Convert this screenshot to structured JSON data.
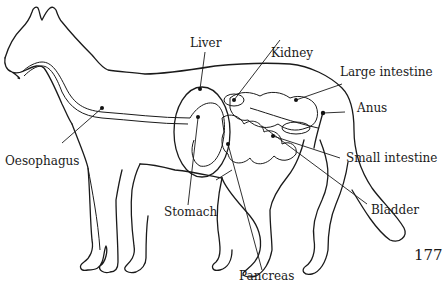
{
  "diagram": {
    "page_number": "177",
    "labels": [
      {
        "id": "liver",
        "text": "Liver"
      },
      {
        "id": "kidney",
        "text": "Kidney"
      },
      {
        "id": "large-intestine",
        "text": "Large intestine"
      },
      {
        "id": "anus",
        "text": "Anus"
      },
      {
        "id": "small-intestine",
        "text": "Small intestine"
      },
      {
        "id": "bladder",
        "text": "Bladder"
      },
      {
        "id": "pancreas",
        "text": "Pancreas"
      },
      {
        "id": "stomach",
        "text": "Stomach"
      },
      {
        "id": "oesophagus",
        "text": "Oesophagus"
      }
    ],
    "colors": {
      "ink": "#1a1a1a",
      "background": "#ffffff"
    }
  }
}
